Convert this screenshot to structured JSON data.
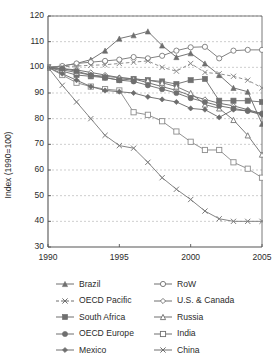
{
  "chart_data": {
    "type": "line",
    "title": "",
    "xlabel": "",
    "ylabel": "Index (1990=100)",
    "xlim": [
      1990,
      2005
    ],
    "ylim": [
      30,
      120
    ],
    "ytick_labels": [
      "120",
      "110",
      "100",
      "90",
      "80",
      "70",
      "60",
      "50",
      "40",
      "30"
    ],
    "yticks": [
      120,
      110,
      100,
      90,
      80,
      70,
      60,
      50,
      40,
      30
    ],
    "xtick_labels": [
      "1990",
      "1995",
      "2000",
      "2005"
    ],
    "xticks": [
      1990,
      1995,
      2000,
      2005
    ],
    "grid": "horizontal-dashed",
    "legend_position": "below-plot-two-columns",
    "x": [
      1990,
      1991,
      1992,
      1993,
      1994,
      1995,
      1996,
      1997,
      1998,
      1999,
      2000,
      2001,
      2002,
      2003,
      2004,
      2005
    ],
    "series": [
      {
        "name": "Brazil",
        "marker": "filled-triangle",
        "linestyle": "solid",
        "color": "#6e6e6e",
        "values": [
          100,
          100.5,
          101.5,
          103,
          106.5,
          111.2,
          112.5,
          114.0,
          108.5,
          104.0,
          105.5,
          101.5,
          97.0,
          92.0,
          90.5,
          78.0
        ]
      },
      {
        "name": "RoW",
        "marker": "open-circle",
        "linestyle": "solid",
        "color": "#7a7a7a",
        "values": [
          100,
          100.5,
          101.5,
          102.0,
          102.5,
          103.0,
          104.0,
          103.5,
          104.5,
          106.5,
          107.8,
          108.0,
          103.5,
          106.5,
          106.8,
          106.8
        ]
      },
      {
        "name": "OECD Pacific",
        "marker": "x",
        "linestyle": "dashed",
        "color": "#8a8a8a",
        "values": [
          100,
          100.2,
          100.5,
          100.8,
          101.0,
          101.5,
          102.0,
          102.5,
          100.0,
          98.5,
          101.5,
          98.0,
          97.5,
          96.5,
          95.0,
          92.0
        ]
      },
      {
        "name": "U.S. & Canada",
        "marker": "open-diamond",
        "linestyle": "solid",
        "color": "#6b6b6b",
        "values": [
          100,
          99.5,
          99.0,
          98.0,
          97.0,
          96.0,
          95.5,
          94.0,
          92.5,
          91.0,
          89.0,
          87.5,
          86.0,
          85.0,
          83.5,
          82.0
        ]
      },
      {
        "name": "South Africa",
        "marker": "filled-square",
        "linestyle": "solid",
        "color": "#707070",
        "values": [
          100,
          98.5,
          97.0,
          96.5,
          96.0,
          95.0,
          95.5,
          95.0,
          94.5,
          93.5,
          95.0,
          95.5,
          87.0,
          87.0,
          87.0,
          86.5
        ]
      },
      {
        "name": "Russia",
        "marker": "open-triangle",
        "linestyle": "solid",
        "color": "#757575",
        "values": [
          100,
          99.0,
          98.0,
          97.0,
          96.5,
          96.0,
          95.5,
          95.0,
          94.0,
          92.5,
          90.0,
          85.5,
          84.0,
          79.5,
          73.5,
          66.0
        ]
      },
      {
        "name": "OECD Europe",
        "marker": "filled-circle",
        "linestyle": "solid",
        "color": "#6f6f6f",
        "values": [
          100,
          99.5,
          98.5,
          97.0,
          96.0,
          95.0,
          94.5,
          93.0,
          91.5,
          90.0,
          88.0,
          86.5,
          85.0,
          84.0,
          83.0,
          82.0
        ]
      },
      {
        "name": "India",
        "marker": "open-square",
        "linestyle": "solid",
        "color": "#8c8c8c",
        "values": [
          100,
          97.0,
          94.0,
          92.5,
          91.5,
          91.0,
          82.5,
          81.5,
          79.0,
          75.0,
          71.0,
          67.8,
          67.8,
          63.0,
          60.5,
          57.0
        ]
      },
      {
        "name": "Mexico",
        "marker": "filled-diamond",
        "linestyle": "solid",
        "color": "#6d6d6d",
        "values": [
          100,
          97.5,
          95.0,
          92.5,
          91.0,
          90.5,
          90.0,
          88.5,
          87.5,
          86.5,
          84.0,
          83.5,
          80.5,
          83.5,
          83.0,
          81.5
        ]
      },
      {
        "name": "China",
        "marker": "x",
        "linestyle": "solid",
        "color": "#7d7d7d",
        "values": [
          100,
          93.0,
          86.5,
          80.0,
          73.5,
          69.5,
          68.5,
          63.0,
          57.0,
          52.5,
          48.5,
          44.0,
          41.0,
          40.0,
          40.0,
          40.0
        ]
      }
    ]
  },
  "legend": {
    "left_column": [
      {
        "label": "Brazil",
        "marker": "filled-triangle",
        "linestyle": "solid"
      },
      {
        "label": "OECD Pacific",
        "marker": "x",
        "linestyle": "dashed"
      },
      {
        "label": "South Africa",
        "marker": "filled-square",
        "linestyle": "solid"
      },
      {
        "label": "OECD Europe",
        "marker": "filled-circle",
        "linestyle": "solid"
      },
      {
        "label": "Mexico",
        "marker": "filled-diamond",
        "linestyle": "solid"
      }
    ],
    "right_column": [
      {
        "label": "RoW",
        "marker": "open-circle",
        "linestyle": "solid"
      },
      {
        "label": "U.S. & Canada",
        "marker": "open-diamond",
        "linestyle": "solid"
      },
      {
        "label": "Russia",
        "marker": "open-triangle",
        "linestyle": "solid"
      },
      {
        "label": "India",
        "marker": "open-square",
        "linestyle": "solid"
      },
      {
        "label": "China",
        "marker": "x",
        "linestyle": "solid"
      }
    ]
  },
  "colors": {
    "axis": "#555555",
    "grid": "#b9b9b9",
    "text": "#2b2b2b",
    "background": "#ffffff"
  }
}
